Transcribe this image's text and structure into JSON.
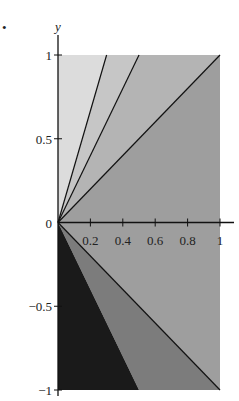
{
  "figure": {
    "marker": "•"
  },
  "chart_data": {
    "type": "area",
    "title": "",
    "xlabel": "",
    "ylabel": "y",
    "xlim": [
      0,
      1
    ],
    "ylim": [
      -1,
      1
    ],
    "grid": false,
    "x_ticks": [
      "0.2",
      "0.4",
      "0.6",
      "0.8",
      "1"
    ],
    "y_ticks": [
      "1",
      "0.5",
      "0",
      "-0.5",
      "-1"
    ],
    "origin_label": "0",
    "lines": [
      {
        "from": [
          0,
          0
        ],
        "to": [
          0.3,
          1
        ]
      },
      {
        "from": [
          0,
          0
        ],
        "to": [
          0.5,
          1
        ]
      },
      {
        "from": [
          0,
          0
        ],
        "to": [
          1,
          1
        ]
      },
      {
        "from": [
          0,
          0
        ],
        "to": [
          1,
          -1
        ]
      }
    ],
    "regions": [
      {
        "name": "upper-left-wedge",
        "vertices": [
          [
            0,
            0
          ],
          [
            0,
            1
          ],
          [
            0.3,
            1
          ]
        ],
        "color": "#dcdcdc"
      },
      {
        "name": "upper-mid-wedge",
        "vertices": [
          [
            0,
            0
          ],
          [
            0.3,
            1
          ],
          [
            0.5,
            1
          ]
        ],
        "color": "#c6c6c6"
      },
      {
        "name": "upper-right-wedge",
        "vertices": [
          [
            0,
            0
          ],
          [
            0.5,
            1
          ],
          [
            1,
            1
          ]
        ],
        "color": "#b4b4b4"
      },
      {
        "name": "middle-wedge",
        "vertices": [
          [
            0,
            0
          ],
          [
            1,
            1
          ],
          [
            1,
            -1
          ]
        ],
        "color": "#9e9e9e"
      },
      {
        "name": "lower-mid-wedge",
        "vertices": [
          [
            0,
            0
          ],
          [
            1,
            -1
          ],
          [
            0.5,
            -1
          ]
        ],
        "color": "#7c7c7c"
      },
      {
        "name": "lower-left-wedge",
        "vertices": [
          [
            0,
            0
          ],
          [
            0.5,
            -1
          ],
          [
            0,
            -1
          ]
        ],
        "color": "#1a1a1a"
      }
    ]
  }
}
